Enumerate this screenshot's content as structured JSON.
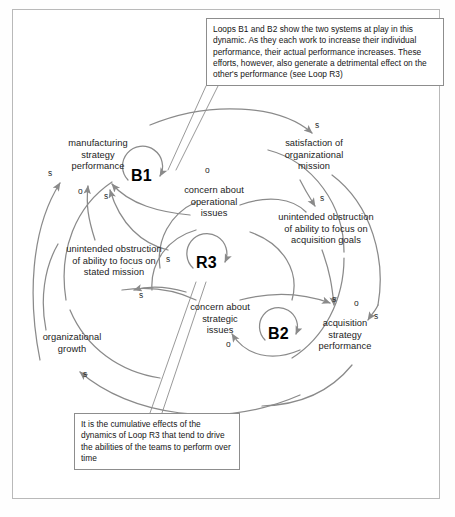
{
  "diagram": {
    "stroke_color": "#8a8a8a",
    "frame_color": "#b9b9b9",
    "nodes": [
      {
        "id": "manufacturing",
        "label": "manufacturing\nstrategy\nperformance"
      },
      {
        "id": "satisfaction",
        "label": "satisfaction of\norganizational\nmission"
      },
      {
        "id": "concern-operational",
        "label": "concern about\noperational\nissues"
      },
      {
        "id": "obstruction-acquisition",
        "label": "unintended obstruction\nof ability to focus on\nacquisition goals"
      },
      {
        "id": "obstruction-stated",
        "label": "unintended obstruction\nof ability to focus on\nstated mission"
      },
      {
        "id": "concern-strategic",
        "label": "concern about\nstrategic\nissues"
      },
      {
        "id": "acquisition",
        "label": "acquisition\nstrategy\nperformance"
      },
      {
        "id": "organizational-growth",
        "label": "organizational\ngrowth"
      }
    ],
    "loops": [
      {
        "id": "b1",
        "label": "B1"
      },
      {
        "id": "r3",
        "label": "R3"
      },
      {
        "id": "b2",
        "label": "B2"
      }
    ],
    "polarities": [
      {
        "id": "p1",
        "label": "s"
      },
      {
        "id": "p2",
        "label": "o"
      },
      {
        "id": "p3",
        "label": "s"
      },
      {
        "id": "p4",
        "label": "o"
      },
      {
        "id": "p5",
        "label": "s"
      },
      {
        "id": "p6",
        "label": "s"
      },
      {
        "id": "p7",
        "label": "s"
      },
      {
        "id": "p8",
        "label": "s"
      },
      {
        "id": "p9",
        "label": "o"
      },
      {
        "id": "p10",
        "label": "s"
      },
      {
        "id": "p11",
        "label": "o"
      },
      {
        "id": "p12",
        "label": "s"
      },
      {
        "id": "p13",
        "label": "s"
      }
    ],
    "callouts": [
      {
        "id": "top",
        "text": "Loops B1 and B2 show the two systems at play in this dynamic. As they each work to increase their individual performance, their actual performance increases. These efforts, however, also generate a detrimental effect on the other's performance (see Loop R3)"
      },
      {
        "id": "bottom",
        "text": "It is the cumulative effects of the dynamics of Loop R3 that tend to drive the abilities of the teams to perform over time"
      }
    ]
  }
}
